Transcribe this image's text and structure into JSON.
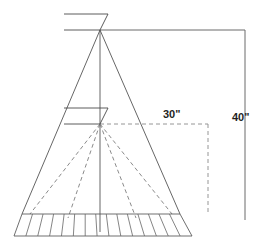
{
  "diagram": {
    "type": "engineering-line-drawing",
    "background_color": "#ffffff",
    "line_color": "#555555",
    "label_color": "#1f1f1f",
    "dimensions": [
      {
        "id": "lower-source-height",
        "label": "30\"",
        "value": 30,
        "unit": "inch",
        "style": "dashed",
        "label_x": 163,
        "label_y": 115,
        "from": {
          "x": 100,
          "y": 124
        },
        "corner": {
          "x": 208,
          "y": 124
        },
        "to": {
          "x": 208,
          "y": 215
        }
      },
      {
        "id": "upper-source-height",
        "label": "40\"",
        "value": 40,
        "unit": "inch",
        "style": "solid",
        "label_x": 232,
        "label_y": 118,
        "from": {
          "x": 100,
          "y": 30
        },
        "corner": {
          "x": 245,
          "y": 30
        },
        "to": {
          "x": 245,
          "y": 220
        }
      }
    ],
    "apexes": [
      {
        "id": "upper-source",
        "x": 100,
        "y": 30,
        "marker": "flag"
      },
      {
        "id": "lower-source",
        "x": 100,
        "y": 124,
        "marker": "flag"
      }
    ],
    "cone": {
      "id": "upper-beam-cone",
      "apex": {
        "x": 100,
        "y": 30
      },
      "base_left": {
        "x": 22,
        "y": 214
      },
      "base_right": {
        "x": 180,
        "y": 214
      },
      "style": "solid"
    },
    "center_axis": {
      "id": "vertical-center-axis",
      "x": 100,
      "y_top": 30,
      "y_bottom": 232,
      "style": "solid"
    },
    "fan_rays": {
      "id": "lower-beam-fan",
      "style": "dashed",
      "apex": {
        "x": 100,
        "y": 124
      },
      "endpoints": [
        {
          "x": 30,
          "y": 214
        },
        {
          "x": 68,
          "y": 218
        },
        {
          "x": 136,
          "y": 218
        },
        {
          "x": 172,
          "y": 214
        }
      ]
    },
    "base_band": {
      "id": "graduated-base-band",
      "top_left": {
        "x": 22,
        "y": 214
      },
      "top_right": {
        "x": 180,
        "y": 214
      },
      "bottom_left": {
        "x": 14,
        "y": 236
      },
      "bottom_right": {
        "x": 192,
        "y": 236
      },
      "division_count": 15,
      "style": "solid"
    },
    "flag_marker": {
      "arm_length": 36,
      "rise": 16,
      "description": "z-shaped source marker"
    }
  }
}
